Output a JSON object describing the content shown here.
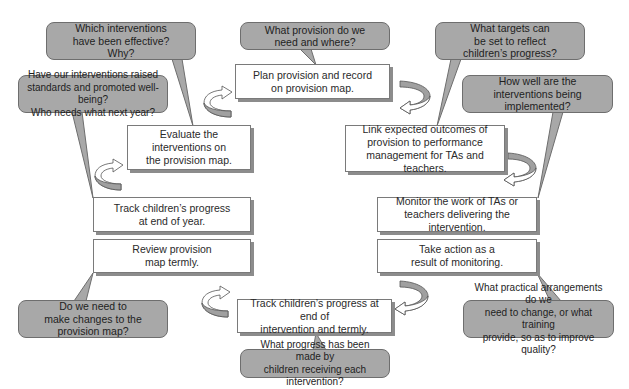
{
  "diagram": {
    "colors": {
      "box_fill": "#ffffff",
      "box_border": "#7a7a7a",
      "box_shadow": "#8c8c8c",
      "bubble_fill": "#a8a8a8",
      "bubble_border": "#6e6e6e",
      "arrow_fill": "#a0a0a0",
      "text": "#2a2a2a"
    },
    "steps": {
      "plan": "Plan provision and record\non provision map.",
      "link": "Link expected outcomes of\nprovision to performance\nmanagement for TAs and teachers.",
      "monitor": "Monitor the work of TAs or\nteachers delivering the intervention.",
      "take_action": "Take action as a\nresult of monitoring.",
      "track_intervention": "Track children’s progress at end of\nintervention and termly.",
      "review": "Review provision\nmap termly.",
      "track_year": "Track children’s progress\nat end of year.",
      "evaluate": "Evaluate the\ninterventions on\nthe provision map."
    },
    "questions": {
      "which_effective": "Which interventions\nhave been effective?\nWhy?",
      "raised_standards": "Have our interventions raised\nstandards and promoted well-being?\nWho needs what next year?",
      "what_provision": "What provision do we\nneed and where?",
      "what_targets": "What targets can\nbe set to reflect\nchildren’s progress?",
      "how_well": "How well are the\ninterventions being\nimplemented?",
      "make_changes": "Do we need to\nmake changes to the\nprovision map?",
      "what_progress": "What progress has been made by\nchildren receiving each intervention?",
      "practical_arrangements": "What practical arrangements do we\nneed to change, or what training\nprovide, so as to improve quality?"
    },
    "arrows": [
      {
        "name": "cycle-arrow-evaluate-to-plan",
        "direction": "clockwise"
      },
      {
        "name": "cycle-arrow-plan-to-link",
        "direction": "clockwise"
      },
      {
        "name": "cycle-arrow-link-to-monitor",
        "direction": "clockwise"
      },
      {
        "name": "cycle-arrow-action-to-track",
        "direction": "clockwise"
      },
      {
        "name": "cycle-arrow-track-to-review",
        "direction": "clockwise"
      },
      {
        "name": "cycle-arrow-year-to-evaluate",
        "direction": "clockwise"
      }
    ]
  }
}
